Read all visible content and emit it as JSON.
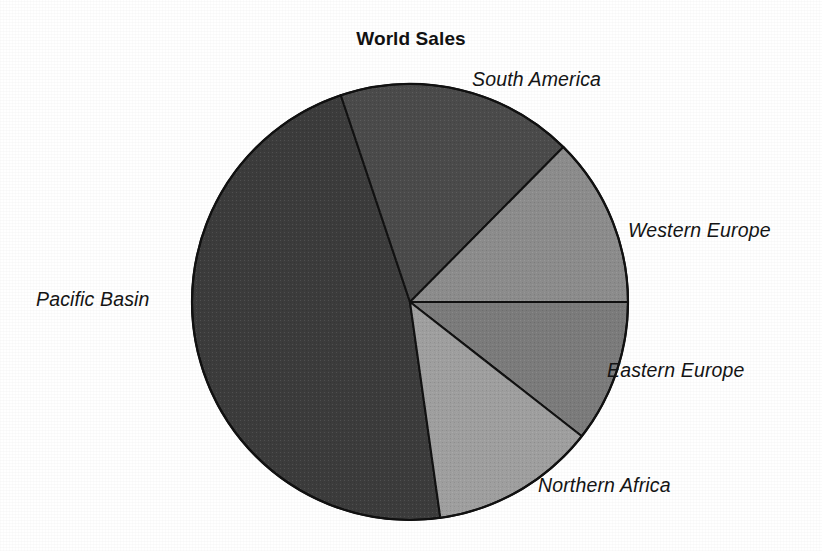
{
  "chart_data": {
    "type": "pie",
    "title": "World Sales",
    "xlabel": "",
    "ylabel": "",
    "legend_position": "none",
    "grid": false,
    "labels_placement": "outside-callout",
    "center": {
      "x": 410,
      "y": 302
    },
    "radius": 218,
    "categories": [
      "South America",
      "Western Europe",
      "Eastern Europe",
      "Northern Africa",
      "Pacific Basin"
    ],
    "values": [
      17.5,
      12.5,
      10.5,
      12.3,
      47.2
    ],
    "units": "percent of total sales",
    "slices": [
      {
        "label": "South America",
        "value": 17.5,
        "angle_degrees": 63,
        "start_angle": 108.5,
        "end_angle": 45.3,
        "color": "#4b4b4b"
      },
      {
        "label": "Western Europe",
        "value": 12.5,
        "angle_degrees": 45,
        "start_angle": 45.3,
        "end_angle": 0,
        "color": "#8d8d8d"
      },
      {
        "label": "Eastern Europe",
        "value": 10.5,
        "angle_degrees": 38,
        "start_angle": 0,
        "end_angle": -38,
        "color": "#7c7c7c"
      },
      {
        "label": "Northern Africa",
        "value": 12.3,
        "angle_degrees": 44,
        "start_angle": -38,
        "end_angle": -82,
        "color": "#a0a0a0"
      },
      {
        "label": "Pacific Basin",
        "value": 47.2,
        "angle_degrees": 170.5,
        "start_angle": -82,
        "end_angle": -251.5,
        "color": "#3c3c3c"
      }
    ]
  },
  "chart": {
    "title": "World Sales",
    "outline_color": "#111111",
    "background_color": "#ffffff",
    "label_color": "#141414"
  },
  "labels": {
    "south_america": "South America",
    "western_europe": "Western Europe",
    "eastern_europe": "Eastern Europe",
    "northern_africa": "Northern Africa",
    "pacific_basin": "Pacific Basin"
  }
}
